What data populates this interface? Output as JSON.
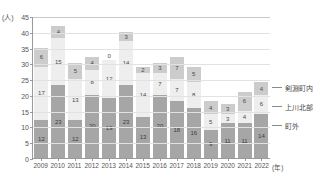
{
  "chart_data": {
    "type": "bar",
    "stacked": true,
    "title": "",
    "xlabel": "(年)",
    "ylabel": "(人)",
    "ylim": [
      0,
      45
    ],
    "ytick_step": 5,
    "yticks": [
      "0",
      "5",
      "10",
      "15",
      "20",
      "25",
      "30",
      "35",
      "40",
      "45"
    ],
    "grid": true,
    "legend_position": "right",
    "categories": [
      "2009",
      "2010",
      "2011",
      "2012",
      "2013",
      "2014",
      "2015",
      "2016",
      "2017",
      "2018",
      "2019",
      "2020",
      "2021",
      "2022"
    ],
    "series": [
      {
        "name": "町外",
        "color": "#a6a6a6",
        "values": [
          12,
          23,
          12,
          20,
          19,
          23,
          13,
          20,
          18,
          16,
          9,
          11,
          11,
          14
        ]
      },
      {
        "name": "上川北部",
        "color": "#eeeeee",
        "values": [
          17,
          15,
          13,
          8,
          12,
          14,
          14,
          7,
          7,
          8,
          5,
          3,
          4,
          6
        ]
      },
      {
        "name": "剣淵町内",
        "color": "#cccccc",
        "values": [
          6,
          4,
          5,
          4,
          0,
          3,
          2,
          3,
          7,
          5,
          4,
          3,
          6,
          4
        ]
      }
    ],
    "totals": [
      35,
      42,
      30,
      32,
      31,
      40,
      29,
      30,
      32,
      29,
      18,
      17,
      21,
      24
    ]
  },
  "axis": {
    "unit_y": "(人)",
    "unit_x": "(年)"
  },
  "legend": {
    "items": [
      {
        "label": "剣淵町内"
      },
      {
        "label": "上川北部"
      },
      {
        "label": "町外"
      }
    ]
  }
}
